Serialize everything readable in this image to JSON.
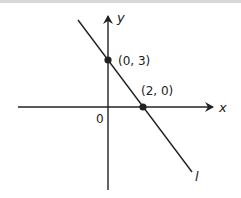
{
  "diagram": {
    "axes": {
      "x_label": "x",
      "y_label": "y",
      "origin_label": "0"
    },
    "line": {
      "label": "l",
      "slope": -1.5,
      "y_intercept": 3
    },
    "points": [
      {
        "label": "(0, 3)",
        "x": 0,
        "y": 3
      },
      {
        "label": "(2, 0)",
        "x": 2,
        "y": 0
      }
    ],
    "colors": {
      "stroke": "#222222",
      "background": "#ffffff"
    }
  }
}
